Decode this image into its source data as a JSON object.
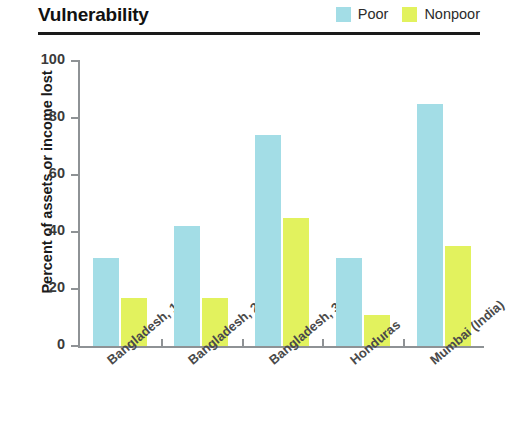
{
  "header": {
    "title": "Vulnerability",
    "legend": [
      {
        "label": "Poor",
        "color": "#a3dde6",
        "icon": "legend-swatch-icon"
      },
      {
        "label": "Nonpoor",
        "color": "#e2f25e",
        "icon": "legend-swatch-icon"
      }
    ]
  },
  "chart_data": {
    "type": "bar",
    "title": "Vulnerability",
    "xlabel": "",
    "ylabel": "Percent of assets or income lost",
    "categories": [
      "Bangladesh, 1",
      "Bangladesh, 2",
      "Bangladesh, 3",
      "Honduras",
      "Mumbai (India)"
    ],
    "series": [
      {
        "name": "Poor",
        "color": "#a3dde6",
        "values": [
          31,
          42,
          74,
          31,
          85
        ]
      },
      {
        "name": "Nonpoor",
        "color": "#e2f25e",
        "values": [
          17,
          17,
          45,
          11,
          35
        ]
      }
    ],
    "ylim": [
      0,
      100
    ],
    "yticks": [
      0,
      20,
      40,
      60,
      80,
      100
    ],
    "ytick_labels": [
      "0",
      "20",
      "40",
      "60",
      "80",
      "100"
    ],
    "grid": false,
    "legend_position": "top-right"
  }
}
